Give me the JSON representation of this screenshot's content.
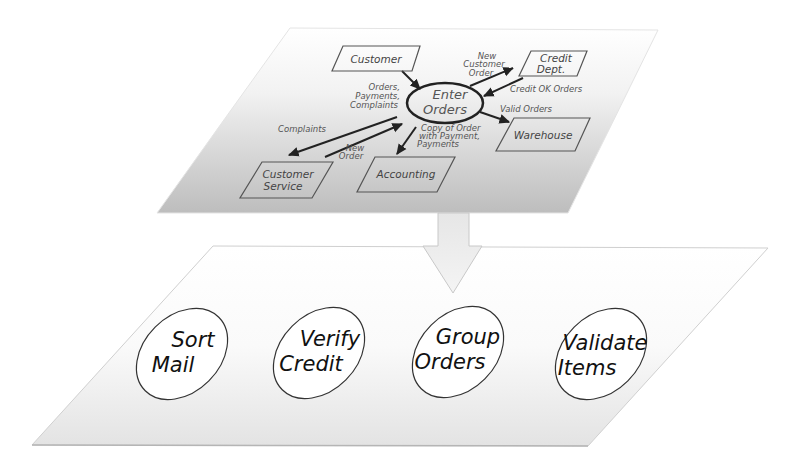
{
  "colors": {
    "top_layer_fill_light": "#ffffff",
    "top_layer_fill_dark": "#b9b9b9",
    "bottom_layer_fill_light": "#ffffff",
    "bottom_layer_fill_dark": "#e2e2e2",
    "stroke": "#333333",
    "label_text": "#555555",
    "arrow_fill": "#eeeeee"
  },
  "top_layer": {
    "title": "Context Diagram",
    "center_process": {
      "line1": "Enter",
      "line2": "Orders"
    },
    "entities": [
      {
        "id": "customer",
        "label": "Customer"
      },
      {
        "id": "credit_dept",
        "line1": "Credit",
        "line2": "Dept."
      },
      {
        "id": "warehouse",
        "label": "Warehouse"
      },
      {
        "id": "accounting",
        "label": "Accounting"
      },
      {
        "id": "customer_service",
        "line1": "Customer",
        "line2": "Service"
      }
    ],
    "flows": [
      {
        "id": "orders_payments_complaints",
        "lines": [
          "Orders,",
          "Payments,",
          "Complaints"
        ]
      },
      {
        "id": "new_customer_order",
        "lines": [
          "New",
          "Customer",
          "Order"
        ]
      },
      {
        "id": "credit_ok_orders",
        "lines": [
          "Credit OK Orders"
        ]
      },
      {
        "id": "valid_orders",
        "lines": [
          "Valid Orders"
        ]
      },
      {
        "id": "copy_of_order",
        "lines": [
          "Copy of Order",
          "with Payment,",
          "Payments"
        ]
      },
      {
        "id": "complaints",
        "lines": [
          "Complaints"
        ]
      },
      {
        "id": "new_order",
        "lines": [
          "New",
          "Order"
        ]
      }
    ]
  },
  "bottom_layer": {
    "title": "Decomposed Processes",
    "processes": [
      {
        "id": "sort_mail",
        "line1": "Sort",
        "line2": "Mail"
      },
      {
        "id": "verify_credit",
        "line1": "Verify",
        "line2": "Credit"
      },
      {
        "id": "group_orders",
        "line1": "Group",
        "line2": "Orders"
      },
      {
        "id": "validate_items",
        "line1": "Validate",
        "line2": "Items"
      }
    ]
  }
}
